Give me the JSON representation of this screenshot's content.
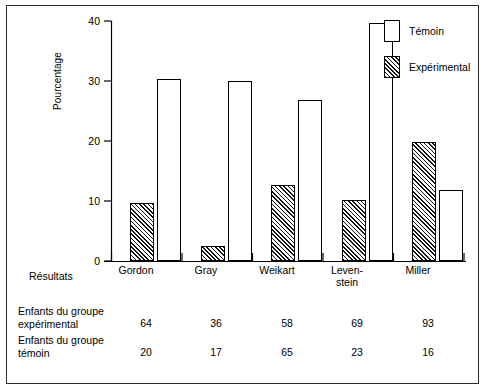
{
  "chart_data": {
    "type": "bar",
    "title": "",
    "xlabel": "Résultats",
    "ylabel": "Pourcentage",
    "ylim": [
      0,
      40
    ],
    "yticks": [
      0,
      10,
      20,
      30,
      40
    ],
    "grid": false,
    "legend_position": "top-right",
    "categories": [
      "Gordon",
      "Gray",
      "Weikart",
      "Leven-\nstein",
      "Miller"
    ],
    "series": [
      {
        "name": "Expérimental",
        "style": "hatched",
        "values": [
          9.6,
          2.5,
          12.6,
          10.1,
          19.8
        ]
      },
      {
        "name": "Témoin",
        "style": "white",
        "values": [
          30.4,
          30.0,
          26.9,
          39.7,
          11.8
        ]
      }
    ],
    "table": {
      "row_labels": [
        "Enfants du groupe\nexpérimental",
        "Enfants du groupe\ntémoin"
      ],
      "rows": [
        [
          "64",
          "36",
          "58",
          "69",
          "93"
        ],
        [
          "20",
          "17",
          "65",
          "23",
          "16"
        ]
      ]
    }
  },
  "legend": {
    "items": [
      {
        "label": "Témoin",
        "swatch": "white-box-icon"
      },
      {
        "label": "Expérimental",
        "swatch": "hatched-box-icon"
      }
    ]
  },
  "axis": {
    "y_label": "Pourcentage",
    "y_tick_labels": [
      "40",
      "30",
      "20",
      "10",
      "0"
    ],
    "x_axis_caption": "Résultats"
  }
}
